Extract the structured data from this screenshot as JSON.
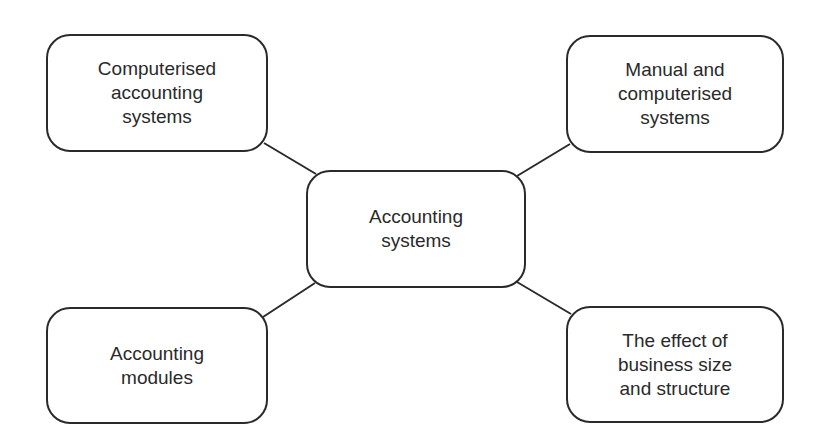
{
  "diagram": {
    "type": "mind-map",
    "center": {
      "label": "Accounting\nsystems"
    },
    "branches": [
      {
        "position": "top-left",
        "label": "Computerised\naccounting\nsystems"
      },
      {
        "position": "top-right",
        "label": "Manual and\ncomputerised\nsystems"
      },
      {
        "position": "bottom-left",
        "label": "Accounting\nmodules"
      },
      {
        "position": "bottom-right",
        "label": "The effect of\nbusiness size\nand structure"
      }
    ],
    "colors": {
      "stroke": "#2a2a2a",
      "text": "#2a2a2a",
      "background": "#ffffff"
    }
  }
}
